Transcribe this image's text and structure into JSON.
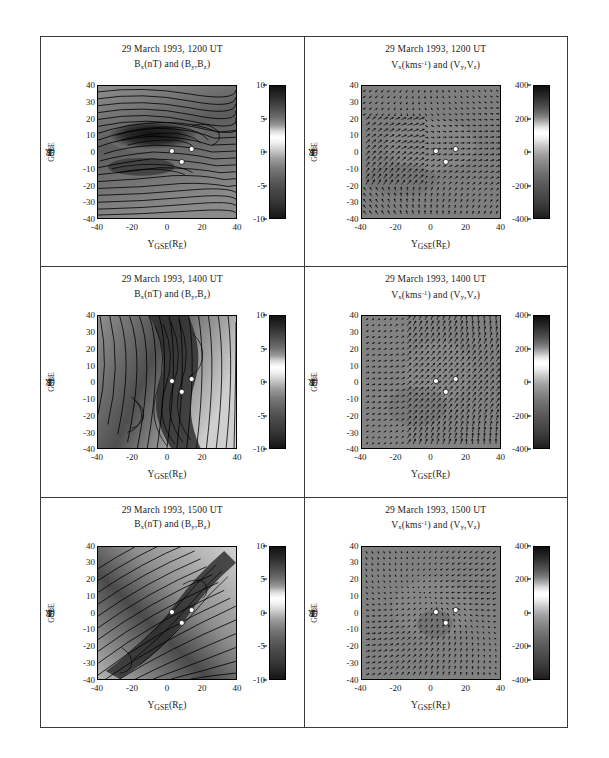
{
  "figure": {
    "layout": "3 rows x 2 columns",
    "caption": "",
    "axes": {
      "xlabel_main": "Y",
      "xlabel_sub": "GSE",
      "xlabel_unit": "(R",
      "xlabel_unit_sub": "E",
      "xlabel_unit_end": ")",
      "ylabel_main": "Z",
      "ylabel_sub": "GSE",
      "ylabel_unit": "(R",
      "ylabel_unit_sub": "E",
      "ylabel_unit_end": ")",
      "xticks": [
        "-40",
        "-20",
        "0",
        "20",
        "40"
      ],
      "yticks": [
        "40",
        "30",
        "20",
        "10",
        "0",
        "-10",
        "-20",
        "-30",
        "-40"
      ],
      "xlim": [
        -40,
        40
      ],
      "ylim": [
        -40,
        40
      ]
    },
    "colorbars": {
      "magnetic": {
        "ticks": [
          "10",
          "5",
          "0",
          "-5",
          "-10"
        ],
        "min": -10,
        "max": 10,
        "unit": "nT"
      },
      "velocity": {
        "ticks": [
          "400",
          "200",
          "0",
          "-200",
          "-400"
        ],
        "min": -400,
        "max": 400,
        "unit": "kms^-1"
      }
    }
  },
  "panels": [
    {
      "id": "b-1200",
      "date": "29 March 1993, 1200 UT",
      "quantity": "B",
      "quantity_sub": "x",
      "quantity_unit": "(nT)",
      "conjunction": " and (B",
      "vec_sub1": "y",
      "vec_mid": ",B",
      "vec_sub2": "z",
      "vec_end": ")",
      "type": "contour"
    },
    {
      "id": "v-1200",
      "date": "29 March 1993, 1200 UT",
      "quantity": "V",
      "quantity_sub": "x",
      "quantity_unit": "(kms",
      "quantity_sup": "-1",
      "quantity_unit_end": ")",
      "conjunction": " and (V",
      "vec_sub1": "y",
      "vec_mid": ",V",
      "vec_sub2": "z",
      "vec_end": ")",
      "type": "vector"
    },
    {
      "id": "b-1400",
      "date": "29 March 1993, 1400 UT",
      "quantity": "B",
      "quantity_sub": "x",
      "quantity_unit": "(nT)",
      "conjunction": " and (B",
      "vec_sub1": "y",
      "vec_mid": ",B",
      "vec_sub2": "z",
      "vec_end": ")",
      "type": "contour"
    },
    {
      "id": "v-1400",
      "date": "29 March 1993, 1400 UT",
      "quantity": "V",
      "quantity_sub": "x",
      "quantity_unit": "(kms",
      "quantity_sup": "-1",
      "quantity_unit_end": ")",
      "conjunction": " and (V",
      "vec_sub1": "y",
      "vec_mid": ",V",
      "vec_sub2": "z",
      "vec_end": ")",
      "type": "vector"
    },
    {
      "id": "b-1500",
      "date": "29 March 1993, 1500 UT",
      "quantity": "B",
      "quantity_sub": "x",
      "quantity_unit": "(nT)",
      "conjunction": " and (B",
      "vec_sub1": "y",
      "vec_mid": ",B",
      "vec_sub2": "z",
      "vec_end": ")",
      "type": "contour"
    },
    {
      "id": "v-1500",
      "date": "29 March 1993, 1500 UT",
      "quantity": "V",
      "quantity_sub": "x",
      "quantity_unit": "(kms",
      "quantity_sup": "-1",
      "quantity_unit_end": ")",
      "conjunction": " and (V",
      "vec_sub1": "y",
      "vec_mid": ",V",
      "vec_sub2": "z",
      "vec_end": ")",
      "type": "vector"
    }
  ],
  "chart_data": {
    "type": "heatmap",
    "xlabel": "Y_GSE (R_E)",
    "ylabel": "Z_GSE (R_E)",
    "xlim": [
      -40,
      40
    ],
    "ylim": [
      -40,
      40
    ],
    "grid": false,
    "legend": "none",
    "colorbar_left": {
      "label": "B_x (nT)",
      "range": [
        -10,
        10
      ],
      "ticks": [
        -10,
        -5,
        0,
        5,
        10
      ]
    },
    "colorbar_right": {
      "label": "V_x (kms^-1)",
      "range": [
        -400,
        400
      ],
      "ticks": [
        -400,
        -200,
        0,
        200,
        400
      ]
    },
    "times": [
      "1200 UT",
      "1400 UT",
      "1500 UT"
    ],
    "spacecraft_markers": [
      {
        "y_gse": 4,
        "z_gse": 0
      },
      {
        "y_gse": 15,
        "z_gse": -1
      },
      {
        "y_gse": 10,
        "z_gse": -7
      }
    ],
    "series": [
      {
        "name": "Bx 1200 UT",
        "panel": "b-1200",
        "field": "Bx",
        "unit": "nT",
        "range": [
          -10,
          10
        ],
        "overlay": "(By,Bz) field lines",
        "structure": "broad horizontal lobe, flattened ellipse centred near (-5,5)"
      },
      {
        "name": "Vx 1200 UT",
        "panel": "v-1200",
        "field": "Vx",
        "unit": "kms^-1",
        "range": [
          -400,
          400
        ],
        "overlay": "(Vy,Vz) arrows",
        "structure": "converging flow jet near Y=-20, fan of strong vectors toward centre"
      },
      {
        "name": "Bx 1400 UT",
        "panel": "b-1400",
        "field": "Bx",
        "unit": "nT",
        "range": [
          -10,
          10
        ],
        "overlay": "(By,Bz) field lines",
        "structure": "steep near-vertical field lines, sharp X-line through centre"
      },
      {
        "name": "Vx 1400 UT",
        "panel": "v-1400",
        "field": "Vx",
        "unit": "kms^-1",
        "range": [
          -400,
          400
        ],
        "overlay": "(Vy,Vz) arrows",
        "structure": "strong upward-right flow channel through the middle of the frame"
      },
      {
        "name": "Bx 1500 UT",
        "panel": "b-1500",
        "field": "Bx",
        "unit": "nT",
        "range": [
          -10,
          10
        ],
        "overlay": "(By,Bz) field lines",
        "structure": "diagonal current sheet tilted ~45 degrees from lower-left to upper-right"
      },
      {
        "name": "Vx 1500 UT",
        "panel": "v-1500",
        "field": "Vx",
        "unit": "kms^-1",
        "range": [
          -400,
          400
        ],
        "overlay": "(Vy,Vz) arrows",
        "structure": "diffuse flow with inward convergence near the spacecraft cluster"
      }
    ]
  }
}
